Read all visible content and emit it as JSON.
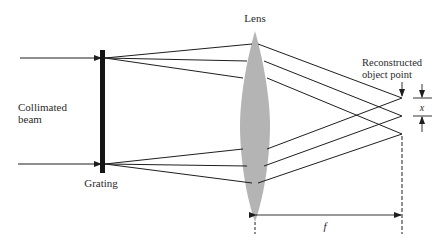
{
  "diagram": {
    "type": "optics-schematic",
    "labels": {
      "lens": "Lens",
      "grating": "Grating",
      "beam_line1": "Collimated",
      "beam_line2": "beam",
      "recon_line1": "Reconstructed",
      "recon_line2": "object point",
      "x_dim": "x",
      "f_dim": "f"
    },
    "colors": {
      "ink": "#1e1e1e",
      "lens_fill": "#b4b4b4",
      "background": "#ffffff"
    }
  }
}
